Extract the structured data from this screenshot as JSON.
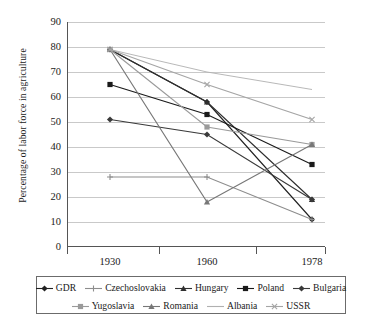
{
  "chart_data": {
    "type": "line",
    "title": "",
    "xlabel": "",
    "ylabel": "Percentage of labor force in agriculture",
    "categories": [
      "1930",
      "1960",
      "1978"
    ],
    "x_positions": [
      1,
      2,
      3
    ],
    "ylim": [
      0,
      90
    ],
    "y_ticks": [
      0,
      10,
      20,
      30,
      40,
      50,
      60,
      70,
      80,
      90
    ],
    "grid": "horizontal",
    "legend_position": "bottom",
    "series": [
      {
        "name": "GDR",
        "values": [
          79,
          58,
          11
        ],
        "color": "#222222",
        "marker": "diamond"
      },
      {
        "name": "Czechoslovakia",
        "values": [
          28,
          28,
          11
        ],
        "color": "#8d8d8d",
        "marker": "plus"
      },
      {
        "name": "Hungary",
        "values": [
          79,
          58,
          19
        ],
        "color": "#2f2f2f",
        "marker": "triangle"
      },
      {
        "name": "Poland",
        "values": [
          65,
          53,
          33
        ],
        "color": "#1a1a1a",
        "marker": "square"
      },
      {
        "name": "Bulgaria",
        "values": [
          51,
          45,
          19
        ],
        "color": "#3a3a3a",
        "marker": "diamond"
      },
      {
        "name": "Yugoslavia",
        "values": [
          79,
          48,
          41
        ],
        "color": "#9a9a9a",
        "marker": "square"
      },
      {
        "name": "Romania",
        "values": [
          79,
          18,
          41
        ],
        "color": "#777777",
        "marker": "triangle"
      },
      {
        "name": "Albania",
        "values": [
          79,
          70,
          63
        ],
        "color": "#b0b0b0",
        "marker": "none"
      },
      {
        "name": "USSR",
        "values": [
          79,
          65,
          51
        ],
        "color": "#a5a5a5",
        "marker": "cross"
      }
    ]
  },
  "axis": {
    "y_title": "Percentage of labor force in agriculture",
    "y_tick_labels": [
      "90",
      "80",
      "70",
      "60",
      "50",
      "40",
      "30",
      "20",
      "10",
      "0"
    ],
    "x_tick_labels": [
      "1930",
      "1960",
      "1978"
    ]
  },
  "legend": {
    "row1": [
      "GDR",
      "Czechoslovakia",
      "Hungary",
      "Poland",
      "Bulgaria"
    ],
    "row2": [
      "Yugoslavia",
      "Romania",
      "Albania",
      "USSR"
    ]
  },
  "colors": {
    "grid": "#c9c9c9",
    "axis": "#555555",
    "background": "#ffffff",
    "legend_border": "#6b6b6b"
  }
}
